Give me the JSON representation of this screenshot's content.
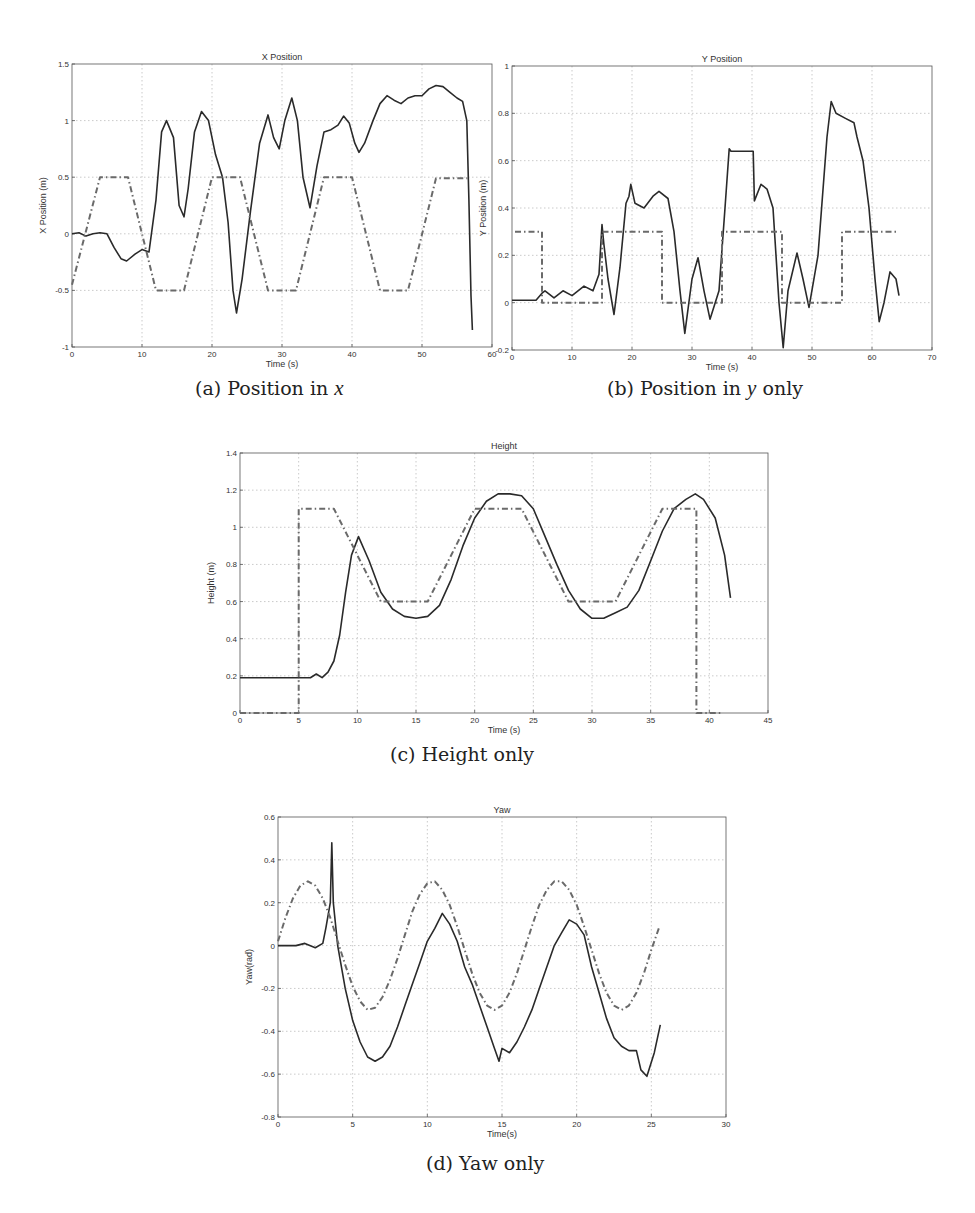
{
  "figures": {
    "a": {
      "caption": {
        "prefix": "(a) Position in ",
        "var": "x",
        "suffix": ""
      }
    },
    "b": {
      "caption": {
        "prefix": "(b) Position in ",
        "var": "y",
        "suffix": " only"
      }
    },
    "c": {
      "caption": {
        "prefix": "(c) Height only",
        "var": "",
        "suffix": ""
      }
    },
    "d": {
      "caption": {
        "prefix": "(d) Yaw only",
        "var": "",
        "suffix": ""
      }
    }
  },
  "style": {
    "actual_color": "#2a2a2a",
    "reference_color": "#6a6a6a",
    "grid_color": "#bdbdbd",
    "axis_color": "#555555"
  },
  "chart_data": [
    {
      "id": "a",
      "type": "line",
      "title": "X Position",
      "xlabel": "Time (s)",
      "ylabel": "X Position (m)",
      "xlim": [
        0,
        60
      ],
      "ylim": [
        -1,
        1.5
      ],
      "xticks": [
        0,
        10,
        20,
        30,
        40,
        50,
        60
      ],
      "yticks": [
        -1,
        -0.5,
        0,
        0.5,
        1,
        1.5
      ],
      "grid": true,
      "legend": null,
      "series": [
        {
          "name": "actual",
          "style": "solid",
          "x": [
            0,
            1,
            2,
            3,
            4,
            5,
            6,
            7,
            7.8,
            9,
            10,
            11,
            12,
            12.8,
            13.5,
            14.5,
            15.3,
            16,
            16.6,
            17.5,
            18.5,
            19.5,
            20.5,
            21.5,
            22.3,
            23,
            23.5,
            24.3,
            25.5,
            26.8,
            28,
            28.8,
            29.6,
            30.4,
            31.4,
            32.2,
            33,
            34,
            35,
            36,
            37,
            38,
            38.8,
            39.6,
            40.4,
            41,
            41.8,
            43,
            44,
            45,
            46,
            47,
            48,
            49,
            50,
            51,
            52,
            53,
            54,
            55,
            55.8,
            56.4,
            56.7,
            57,
            57.2
          ],
          "y": [
            0,
            0.01,
            -0.02,
            0,
            0.01,
            0,
            -0.12,
            -0.22,
            -0.24,
            -0.18,
            -0.14,
            -0.16,
            0.3,
            0.9,
            1.0,
            0.85,
            0.25,
            0.15,
            0.4,
            0.9,
            1.08,
            1.0,
            0.7,
            0.5,
            0.1,
            -0.5,
            -0.7,
            -0.4,
            0.2,
            0.8,
            1.05,
            0.85,
            0.75,
            1.0,
            1.2,
            1.0,
            0.5,
            0.23,
            0.6,
            0.9,
            0.92,
            0.96,
            1.04,
            0.98,
            0.8,
            0.72,
            0.8,
            1.0,
            1.15,
            1.22,
            1.18,
            1.15,
            1.2,
            1.22,
            1.22,
            1.28,
            1.31,
            1.3,
            1.25,
            1.2,
            1.17,
            1.0,
            0.3,
            -0.55,
            -0.85
          ]
        },
        {
          "name": "reference",
          "style": "dashdot",
          "x": [
            0,
            4,
            8,
            12,
            16,
            20,
            24,
            28,
            32,
            36,
            40,
            44,
            48,
            52,
            56.5
          ],
          "y": [
            -0.45,
            0.5,
            0.5,
            -0.5,
            -0.5,
            0.5,
            0.5,
            -0.5,
            -0.5,
            0.5,
            0.5,
            -0.5,
            -0.5,
            0.49,
            0.49
          ]
        }
      ]
    },
    {
      "id": "b",
      "type": "line",
      "title": "Y Position",
      "xlabel": "Time (s)",
      "ylabel": "Y Position (m)",
      "xlim": [
        0,
        70
      ],
      "ylim": [
        -0.2,
        1
      ],
      "xticks": [
        0,
        10,
        20,
        30,
        40,
        50,
        60,
        70
      ],
      "yticks": [
        -0.2,
        0,
        0.2,
        0.4,
        0.6,
        0.8,
        1
      ],
      "grid": true,
      "legend": null,
      "series": [
        {
          "name": "actual",
          "style": "solid",
          "x": [
            0,
            4,
            5,
            5.5,
            7,
            8.5,
            10,
            12,
            13.5,
            14.5,
            15,
            15.3,
            16,
            17,
            18,
            19,
            19.5,
            19.8,
            20.5,
            22,
            23.5,
            24.5,
            26,
            27,
            28,
            28.8,
            30,
            31,
            32,
            33,
            34.5,
            35.5,
            36.2,
            36.5,
            40.2,
            40.4,
            41.5,
            42.5,
            43.5,
            44.5,
            45.2,
            46,
            47.5,
            48.5,
            49.5,
            51,
            52.5,
            53.2,
            54,
            55.5,
            57,
            57.5,
            58.5,
            59.5,
            60.5,
            61.2,
            62,
            63,
            64,
            64.5
          ],
          "y": [
            0.01,
            0.01,
            0.04,
            0.05,
            0.02,
            0.05,
            0.03,
            0.07,
            0.05,
            0.12,
            0.33,
            0.25,
            0.1,
            -0.05,
            0.15,
            0.42,
            0.45,
            0.5,
            0.42,
            0.4,
            0.45,
            0.47,
            0.44,
            0.3,
            0.05,
            -0.13,
            0.1,
            0.19,
            0.05,
            -0.07,
            0.05,
            0.4,
            0.65,
            0.64,
            0.64,
            0.43,
            0.5,
            0.48,
            0.4,
            0.0,
            -0.19,
            0.05,
            0.21,
            0.1,
            -0.02,
            0.2,
            0.7,
            0.85,
            0.8,
            0.78,
            0.76,
            0.7,
            0.6,
            0.4,
            0.1,
            -0.08,
            0.0,
            0.13,
            0.1,
            0.03
          ]
        },
        {
          "name": "reference",
          "style": "dashdot",
          "x": [
            0.5,
            5,
            5,
            15,
            15,
            25,
            25,
            35,
            35,
            45,
            45,
            55,
            55,
            64.5
          ],
          "y": [
            0.3,
            0.3,
            0,
            0,
            0.3,
            0.3,
            0,
            0,
            0.3,
            0.3,
            0,
            0,
            0.3,
            0.3
          ]
        }
      ]
    },
    {
      "id": "c",
      "type": "line",
      "title": "Height",
      "xlabel": "Time (s)",
      "ylabel": "Height (m)",
      "xlim": [
        0,
        45
      ],
      "ylim": [
        0,
        1.4
      ],
      "xticks": [
        0,
        5,
        10,
        15,
        20,
        25,
        30,
        35,
        40,
        45
      ],
      "yticks": [
        0,
        0.2,
        0.4,
        0.6,
        0.8,
        1,
        1.2,
        1.4
      ],
      "grid": true,
      "legend": null,
      "series": [
        {
          "name": "actual",
          "style": "solid",
          "x": [
            0,
            6,
            6.5,
            7,
            7.5,
            8,
            8.5,
            9,
            9.5,
            10.1,
            11,
            12,
            13,
            14,
            15,
            16,
            17,
            18,
            19,
            20,
            21,
            22,
            23,
            24,
            25,
            26,
            27,
            28,
            29,
            30,
            31,
            32,
            33,
            34,
            35,
            36,
            37,
            38,
            38.8,
            39.5,
            40.5,
            41.3,
            41.8
          ],
          "y": [
            0.19,
            0.19,
            0.21,
            0.19,
            0.22,
            0.28,
            0.42,
            0.65,
            0.85,
            0.95,
            0.82,
            0.65,
            0.56,
            0.52,
            0.51,
            0.52,
            0.58,
            0.72,
            0.9,
            1.05,
            1.14,
            1.18,
            1.18,
            1.17,
            1.1,
            0.95,
            0.8,
            0.66,
            0.56,
            0.51,
            0.51,
            0.54,
            0.57,
            0.66,
            0.82,
            0.98,
            1.1,
            1.15,
            1.18,
            1.15,
            1.05,
            0.85,
            0.62
          ]
        },
        {
          "name": "reference",
          "style": "dashdot",
          "x": [
            0,
            5,
            5,
            8,
            12,
            16,
            20,
            24,
            28,
            32,
            36,
            38.9,
            38.9,
            41
          ],
          "y": [
            0,
            0,
            1.1,
            1.1,
            0.6,
            0.6,
            1.1,
            1.1,
            0.6,
            0.6,
            1.1,
            1.1,
            0,
            0
          ]
        }
      ]
    },
    {
      "id": "d",
      "type": "line",
      "title": "Yaw",
      "xlabel": "Time(s)",
      "ylabel": "Yaw(rad)",
      "xlim": [
        0,
        30
      ],
      "ylim": [
        -0.8,
        0.6
      ],
      "xticks": [
        0,
        5,
        10,
        15,
        20,
        25,
        30
      ],
      "yticks": [
        -0.8,
        -0.6,
        -0.4,
        -0.2,
        0,
        0.2,
        0.4,
        0.6
      ],
      "grid": true,
      "legend": null,
      "series": [
        {
          "name": "actual",
          "style": "solid",
          "x": [
            0,
            1.2,
            1.8,
            2.5,
            3.0,
            3.2,
            3.5,
            3.6,
            3.7,
            4.0,
            4.5,
            5,
            5.5,
            6,
            6.5,
            7,
            7.5,
            8,
            8.5,
            9,
            9.5,
            10,
            10.5,
            11,
            11.5,
            12,
            12.5,
            13,
            13.5,
            14,
            14.5,
            14.8,
            15,
            15.5,
            16,
            16.5,
            17,
            17.5,
            18,
            18.5,
            19,
            19.5,
            20,
            20.5,
            21,
            21.5,
            22,
            22.5,
            23,
            23.5,
            24,
            24.3,
            24.7,
            25.2,
            25.6
          ],
          "y": [
            0,
            0,
            0.01,
            -0.01,
            0.01,
            0.08,
            0.2,
            0.48,
            0.2,
            0.0,
            -0.2,
            -0.35,
            -0.45,
            -0.52,
            -0.54,
            -0.52,
            -0.47,
            -0.38,
            -0.28,
            -0.18,
            -0.08,
            0.02,
            0.08,
            0.15,
            0.1,
            0.02,
            -0.1,
            -0.18,
            -0.28,
            -0.38,
            -0.48,
            -0.54,
            -0.48,
            -0.5,
            -0.45,
            -0.38,
            -0.3,
            -0.2,
            -0.1,
            0.0,
            0.06,
            0.12,
            0.1,
            0.05,
            -0.1,
            -0.22,
            -0.34,
            -0.43,
            -0.47,
            -0.49,
            -0.49,
            -0.58,
            -0.61,
            -0.5,
            -0.37
          ]
        },
        {
          "name": "reference",
          "style": "dashdot",
          "x": [
            0,
            0.5,
            1,
            1.5,
            2,
            2.5,
            3,
            3.5,
            4,
            4.5,
            5,
            5.5,
            6,
            6.5,
            7,
            7.5,
            8,
            8.5,
            9,
            9.5,
            10,
            10.5,
            11,
            11.5,
            12,
            12.5,
            13,
            13.5,
            14,
            14.5,
            15,
            15.5,
            16,
            16.5,
            17,
            17.5,
            18,
            18.5,
            19,
            19.5,
            20,
            20.5,
            21,
            21.5,
            22,
            22.5,
            23,
            23.5,
            24,
            24.5,
            25,
            25.5
          ],
          "y": [
            0.02,
            0.13,
            0.22,
            0.28,
            0.3,
            0.28,
            0.22,
            0.13,
            0.02,
            -0.09,
            -0.19,
            -0.26,
            -0.3,
            -0.29,
            -0.24,
            -0.16,
            -0.06,
            0.05,
            0.16,
            0.24,
            0.29,
            0.3,
            0.26,
            0.19,
            0.09,
            -0.02,
            -0.13,
            -0.22,
            -0.28,
            -0.3,
            -0.28,
            -0.22,
            -0.13,
            -0.02,
            0.09,
            0.19,
            0.26,
            0.3,
            0.3,
            0.26,
            0.19,
            0.09,
            -0.02,
            -0.13,
            -0.22,
            -0.28,
            -0.3,
            -0.28,
            -0.22,
            -0.13,
            -0.02,
            0.08
          ]
        }
      ]
    }
  ]
}
